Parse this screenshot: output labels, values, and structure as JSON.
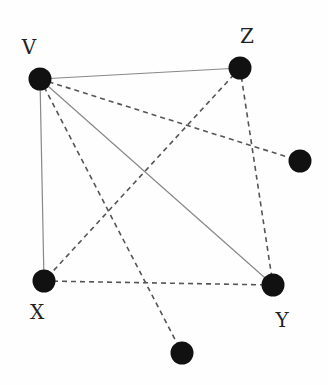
{
  "diagram": {
    "type": "graph",
    "nodes": [
      {
        "id": "V",
        "label": "V",
        "x": 40,
        "y": 79,
        "lx": 29,
        "ly": 54
      },
      {
        "id": "Z",
        "label": "Z",
        "x": 240,
        "y": 68,
        "lx": 247,
        "ly": 43
      },
      {
        "id": "R",
        "label": "",
        "x": 300,
        "y": 161,
        "lx": 0,
        "ly": 0
      },
      {
        "id": "X",
        "label": "X",
        "x": 44,
        "y": 281,
        "lx": 37,
        "ly": 319
      },
      {
        "id": "Y",
        "label": "Y",
        "x": 273,
        "y": 285,
        "lx": 282,
        "ly": 327
      },
      {
        "id": "B",
        "label": "",
        "x": 182,
        "y": 353,
        "lx": 0,
        "ly": 0
      }
    ],
    "edges": [
      {
        "from": "V",
        "to": "Z",
        "style": "solid"
      },
      {
        "from": "V",
        "to": "X",
        "style": "solid"
      },
      {
        "from": "V",
        "to": "Y",
        "style": "solid"
      },
      {
        "from": "V",
        "to": "R",
        "style": "dashed"
      },
      {
        "from": "V",
        "to": "B",
        "style": "dashed"
      },
      {
        "from": "Z",
        "to": "X",
        "style": "dashed"
      },
      {
        "from": "Z",
        "to": "Y",
        "style": "dashed"
      },
      {
        "from": "X",
        "to": "Y",
        "style": "dashed"
      }
    ],
    "colors": {
      "node": "#111111",
      "solid_edge": "#888888",
      "dashed_edge": "#555555"
    }
  }
}
